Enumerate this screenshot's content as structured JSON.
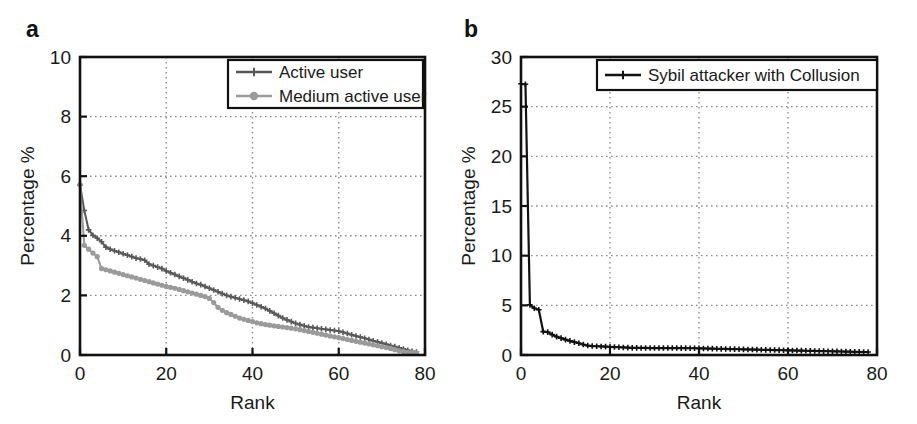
{
  "figure": {
    "panels": [
      {
        "id": "a",
        "label": "a",
        "xlabel": "Rank",
        "ylabel": "Percentage %",
        "xticks": [
          "0",
          "20",
          "40",
          "60",
          "80"
        ],
        "yticks": [
          "0",
          "2",
          "4",
          "6",
          "8",
          "10"
        ],
        "legend": [
          {
            "label": "Active user",
            "color": "#595959",
            "marker": "plus"
          },
          {
            "label": "Medium active user",
            "color": "#9a9a9a",
            "marker": "circle"
          }
        ]
      },
      {
        "id": "b",
        "label": "b",
        "xlabel": "Rank",
        "ylabel": "Percentage %",
        "xticks": [
          "0",
          "20",
          "40",
          "60",
          "80"
        ],
        "yticks": [
          "0",
          "5",
          "10",
          "15",
          "20",
          "25",
          "30"
        ],
        "legend": [
          {
            "label": "Sybil attacker with Collusion",
            "color": "#111111",
            "marker": "plus"
          }
        ]
      }
    ]
  },
  "chart_data": [
    {
      "type": "line",
      "panel": "a",
      "title": "",
      "xlabel": "Rank",
      "ylabel": "Percentage %",
      "xlim": [
        0,
        80
      ],
      "ylim": [
        0,
        10
      ],
      "xticks": [
        0,
        20,
        40,
        60,
        80
      ],
      "yticks": [
        0,
        2,
        4,
        6,
        8,
        10
      ],
      "grid": true,
      "legend_position": "top-right",
      "x": [
        0,
        1,
        2,
        3,
        4,
        5,
        6,
        7,
        8,
        9,
        10,
        11,
        12,
        13,
        14,
        15,
        16,
        17,
        18,
        19,
        20,
        21,
        22,
        23,
        24,
        25,
        26,
        27,
        28,
        29,
        30,
        31,
        32,
        33,
        34,
        35,
        36,
        37,
        38,
        39,
        40,
        41,
        42,
        43,
        44,
        45,
        46,
        47,
        48,
        49,
        50,
        51,
        52,
        53,
        54,
        55,
        56,
        57,
        58,
        59,
        60,
        61,
        62,
        63,
        64,
        65,
        66,
        67,
        68,
        69,
        70,
        71,
        72,
        73,
        74,
        75,
        76,
        77,
        78
      ],
      "series": [
        {
          "name": "Active user",
          "color": "#595959",
          "marker": "plus",
          "values": [
            5.7,
            4.85,
            4.2,
            4.02,
            3.92,
            3.8,
            3.62,
            3.55,
            3.5,
            3.45,
            3.4,
            3.35,
            3.3,
            3.25,
            3.22,
            3.18,
            3.05,
            3.0,
            2.95,
            2.9,
            2.82,
            2.76,
            2.7,
            2.64,
            2.58,
            2.52,
            2.46,
            2.4,
            2.36,
            2.3,
            2.24,
            2.18,
            2.12,
            2.06,
            2.0,
            1.96,
            1.92,
            1.88,
            1.84,
            1.8,
            1.74,
            1.68,
            1.62,
            1.56,
            1.48,
            1.4,
            1.32,
            1.24,
            1.18,
            1.12,
            1.06,
            1.02,
            0.98,
            0.94,
            0.92,
            0.9,
            0.88,
            0.86,
            0.84,
            0.82,
            0.8,
            0.76,
            0.72,
            0.68,
            0.64,
            0.6,
            0.56,
            0.52,
            0.48,
            0.44,
            0.4,
            0.36,
            0.32,
            0.28,
            0.24,
            0.2,
            0.16,
            0.12,
            0.1
          ]
        },
        {
          "name": "Medium active user",
          "color": "#9a9a9a",
          "marker": "circle",
          "values": [
            5.72,
            3.68,
            3.55,
            3.42,
            3.3,
            2.9,
            2.86,
            2.82,
            2.78,
            2.74,
            2.7,
            2.66,
            2.62,
            2.58,
            2.54,
            2.5,
            2.46,
            2.42,
            2.38,
            2.34,
            2.3,
            2.27,
            2.24,
            2.2,
            2.16,
            2.12,
            2.08,
            2.04,
            2.0,
            1.96,
            1.9,
            1.76,
            1.6,
            1.5,
            1.42,
            1.36,
            1.3,
            1.24,
            1.2,
            1.16,
            1.12,
            1.08,
            1.05,
            1.02,
            1.0,
            0.98,
            0.96,
            0.94,
            0.92,
            0.9,
            0.88,
            0.85,
            0.82,
            0.79,
            0.76,
            0.73,
            0.7,
            0.67,
            0.64,
            0.61,
            0.58,
            0.55,
            0.52,
            0.49,
            0.46,
            0.43,
            0.4,
            0.37,
            0.34,
            0.31,
            0.28,
            0.25,
            0.22,
            0.18,
            0.14,
            0.11,
            0.09,
            0.08,
            0.07
          ]
        }
      ]
    },
    {
      "type": "line",
      "panel": "b",
      "title": "",
      "xlabel": "Rank",
      "ylabel": "Percentage %",
      "xlim": [
        0,
        80
      ],
      "ylim": [
        0,
        30
      ],
      "xticks": [
        0,
        20,
        40,
        60,
        80
      ],
      "yticks": [
        0,
        5,
        10,
        15,
        20,
        25,
        30
      ],
      "grid": true,
      "legend_position": "top-right",
      "x": [
        0,
        1,
        2,
        3,
        4,
        5,
        6,
        7,
        8,
        9,
        10,
        11,
        12,
        13,
        14,
        15,
        16,
        17,
        18,
        19,
        20,
        21,
        22,
        23,
        24,
        25,
        26,
        27,
        28,
        29,
        30,
        31,
        32,
        33,
        34,
        35,
        36,
        37,
        38,
        39,
        40,
        41,
        42,
        43,
        44,
        45,
        46,
        47,
        48,
        49,
        50,
        51,
        52,
        53,
        54,
        55,
        56,
        57,
        58,
        59,
        60,
        61,
        62,
        63,
        64,
        65,
        66,
        67,
        68,
        69,
        70,
        71,
        72,
        73,
        74,
        75,
        76,
        77,
        78
      ],
      "series": [
        {
          "name": "Sybil attacker with Collusion",
          "color": "#111111",
          "marker": "plus",
          "values": [
            27.3,
            27.25,
            5.05,
            4.7,
            4.55,
            2.35,
            2.3,
            2.05,
            1.85,
            1.7,
            1.55,
            1.42,
            1.3,
            1.18,
            1.05,
            0.95,
            0.9,
            0.88,
            0.86,
            0.84,
            0.82,
            0.8,
            0.78,
            0.76,
            0.74,
            0.72,
            0.72,
            0.71,
            0.71,
            0.7,
            0.7,
            0.7,
            0.7,
            0.7,
            0.7,
            0.7,
            0.69,
            0.69,
            0.68,
            0.68,
            0.67,
            0.66,
            0.65,
            0.64,
            0.63,
            0.62,
            0.61,
            0.6,
            0.59,
            0.58,
            0.57,
            0.56,
            0.55,
            0.54,
            0.53,
            0.52,
            0.51,
            0.5,
            0.49,
            0.48,
            0.47,
            0.46,
            0.45,
            0.44,
            0.43,
            0.42,
            0.41,
            0.4,
            0.39,
            0.38,
            0.37,
            0.36,
            0.35,
            0.34,
            0.33,
            0.32,
            0.31,
            0.3,
            0.3
          ]
        }
      ]
    }
  ]
}
